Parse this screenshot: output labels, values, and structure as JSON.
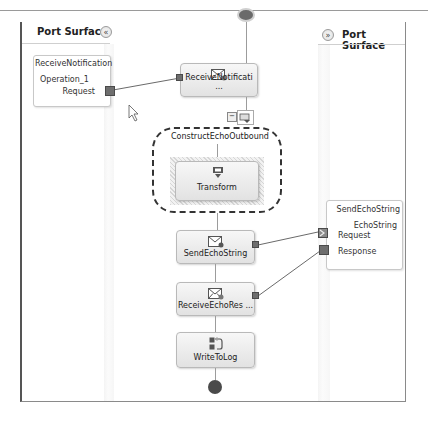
{
  "left_panel": {
    "title": "Port Surface",
    "collapse_glyph": "«",
    "port": {
      "name": "ReceiveNotification",
      "operation": "Operation_1",
      "message": "Request"
    }
  },
  "right_panel": {
    "title": "Port Surface",
    "expand_glyph": "»",
    "port": {
      "name": "SendEchoString",
      "operation": "EchoString",
      "messages": [
        "Request",
        "Response"
      ]
    }
  },
  "orchestration": {
    "start_shape": "start",
    "shapes": [
      {
        "id": "receive-notification",
        "label": "ReceiveNotificati ...",
        "icon": "receive-envelope-icon"
      },
      {
        "id": "construct",
        "label": "ConstructEchoOutbound",
        "icon": "construct-message-icon",
        "expander": "−"
      },
      {
        "id": "transform",
        "label": "Transform",
        "icon": "transform-icon"
      },
      {
        "id": "send-echo-string",
        "label": "SendEchoString",
        "icon": "send-envelope-icon"
      },
      {
        "id": "receive-echo-response",
        "label": "ReceiveEchoRes ...",
        "icon": "receive-envelope-icon"
      },
      {
        "id": "write-to-log",
        "label": "WriteToLog",
        "icon": "expression-icon"
      }
    ],
    "end_shape": "end"
  },
  "colors": {
    "frame_border": "#555555",
    "shape_fill_top": "#f7f7f7",
    "shape_fill_bottom": "#e2e2e2",
    "connector": "#6a6a6a",
    "port_square": "#6e6e6e"
  }
}
